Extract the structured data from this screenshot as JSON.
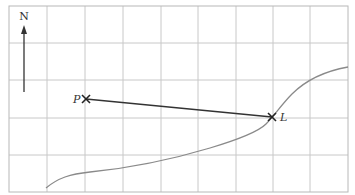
{
  "diagram": {
    "north_label": "N",
    "points": [
      {
        "id": "P",
        "label": "P",
        "x": 86,
        "y": 99
      },
      {
        "id": "L",
        "label": "L",
        "x": 272,
        "y": 117
      }
    ],
    "colors": {
      "grid": "#c8c8c8",
      "curve": "#8a8a8a",
      "line": "#333333"
    }
  }
}
